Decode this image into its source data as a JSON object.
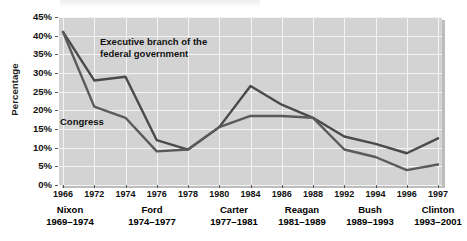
{
  "figure": {
    "ylabel": "Percentage",
    "annotations": [
      {
        "name": "series-label-executive",
        "text": "Executive branch of the\nfederal government",
        "x": 100,
        "y": 36
      },
      {
        "name": "series-label-congress",
        "text": "Congress",
        "x": 60,
        "y": 116
      }
    ]
  },
  "yticks": [
    "45%",
    "40%",
    "35%",
    "30%",
    "25%",
    "20%",
    "15%",
    "10%",
    "5%",
    "0%"
  ],
  "presidents": [
    {
      "name": "Nixon",
      "years": "1969–1974"
    },
    {
      "name": "Ford",
      "years": "1974–1977"
    },
    {
      "name": "Carter",
      "years": "1977–1981"
    },
    {
      "name": "Reagan",
      "years": "1981–1989"
    },
    {
      "name": "Bush",
      "years": "1989–1993"
    },
    {
      "name": "Clinton",
      "years": "1993–2001"
    }
  ],
  "colors": {
    "executive": "#4a4a4a",
    "congress": "#5a5a5a",
    "panel": "#d3d3d3",
    "grid": "#f4f4f4",
    "text": "#111111"
  },
  "chart_data": {
    "type": "line",
    "title": "",
    "xlabel": "",
    "ylabel": "Percentage",
    "ylim": [
      0,
      45
    ],
    "ytick_step": 5,
    "grid": true,
    "legend": "inline-annotations",
    "categories": [
      "1966",
      "1972",
      "1974",
      "1976",
      "1978",
      "1980",
      "1984",
      "1986",
      "1988",
      "1992",
      "1994",
      "1996",
      "1997"
    ],
    "series": [
      {
        "name": "Executive branch of the federal government",
        "values": [
          41,
          28,
          29,
          12,
          9.5,
          15.5,
          26.5,
          21.5,
          18,
          13,
          11,
          8.5,
          12.5
        ]
      },
      {
        "name": "Congress",
        "values": [
          41,
          21,
          18,
          9,
          9.5,
          15.5,
          18.5,
          18.5,
          18,
          9.5,
          7.5,
          4,
          5.5
        ]
      }
    ]
  }
}
